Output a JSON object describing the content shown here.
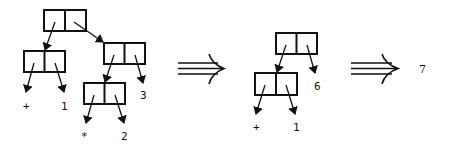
{
  "diagram": {
    "stages": [
      {
        "name": "stage-1",
        "expression": "(+ 1 (* 2) 3) as cons cells",
        "leaves": [
          "+",
          "1",
          "3",
          "*",
          "2"
        ]
      },
      {
        "name": "stage-2",
        "leaves": [
          "6",
          "+",
          "1"
        ]
      },
      {
        "name": "stage-3",
        "result": "7"
      }
    ],
    "labels": {
      "s1_plus": "+",
      "s1_one": "1",
      "s1_three": "3",
      "s1_star": "*",
      "s1_two": "2",
      "s2_six": "6",
      "s2_plus": "+",
      "s2_one": "1",
      "s3_result": "7"
    },
    "transitions": [
      "implies-arrow",
      "implies-arrow"
    ]
  }
}
